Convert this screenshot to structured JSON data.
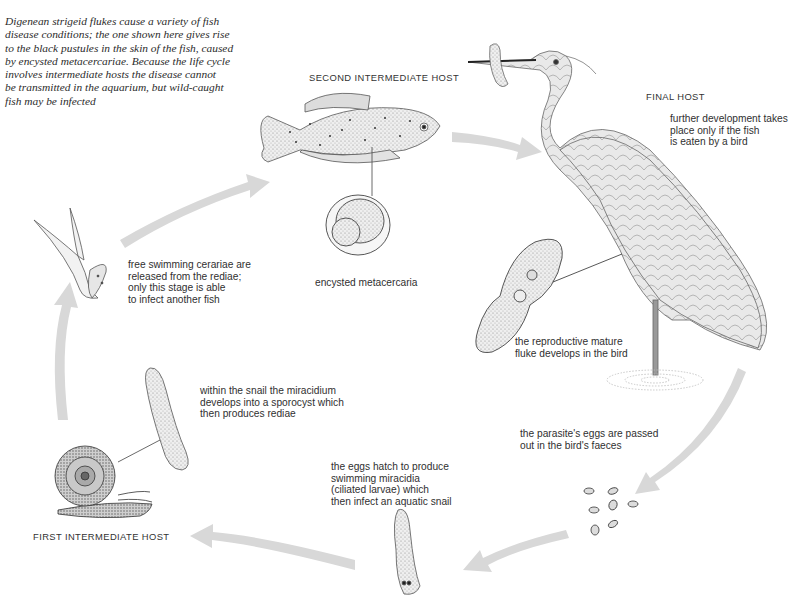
{
  "intro": {
    "text": "Digenean strigeid flukes cause a variety of fish\ndisease conditions; the one shown here gives rise\nto the black pustules in the skin of the fish, caused\nby encysted metacercariae. Because the life cycle\ninvolves intermediate hosts the disease cannot\nbe transmitted in the aquarium, but wild-caught\nfish may be infected"
  },
  "hosts": {
    "second": "SECOND INTERMEDIATE HOST",
    "final": "FINAL HOST",
    "first": "FIRST INTERMEDIATE HOST"
  },
  "stages": [
    {
      "id": "final-host-note",
      "text": "further development takes\nplace only if the fish\nis eaten by a bird"
    },
    {
      "id": "metacercaria",
      "text": "encysted metacercaria"
    },
    {
      "id": "cercariae",
      "text": "free swimming cerariae are\nreleased from the rediae;\nonly this stage is able\nto infect another fish"
    },
    {
      "id": "mature-fluke",
      "text": "the reproductive mature\nfluke develops in the bird"
    },
    {
      "id": "sporocyst",
      "text": "within the snail the miracidium\ndevelops into a sporocyst which\nthen produces rediae"
    },
    {
      "id": "eggs",
      "text": "the parasite's eggs are passed\nout in the bird's faeces"
    },
    {
      "id": "miracidia",
      "text": "the eggs hatch to produce\nswimming miracidia\n(ciliated larvae) which\nthen infect an aquatic snail"
    }
  ],
  "colors": {
    "arrow": "#d6d6d6",
    "ink": "#2a2a2a",
    "stipple": "#9a9a9a"
  }
}
